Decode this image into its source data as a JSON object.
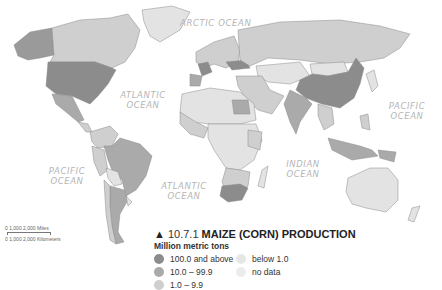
{
  "figure": {
    "number": "10.7.1",
    "title": "MAIZE (CORN) PRODUCTION",
    "marker": "▲"
  },
  "legend": {
    "unit": "Million metric tons",
    "items": [
      {
        "label": "100.0 and above",
        "color": "#8c8c8c"
      },
      {
        "label": "below 1.0",
        "color": "#e6e6e6"
      },
      {
        "label": "10.0 – 99.9",
        "color": "#aaaaaa"
      },
      {
        "label": "no data",
        "color": "#ececec"
      },
      {
        "label": "1.0 – 9.9",
        "color": "#cfcfcf"
      }
    ]
  },
  "oceans": {
    "arctic": "ARCTIC OCEAN",
    "atlantic_north": "ATLANTIC OCEAN",
    "atlantic_south": "ATLANTIC OCEAN",
    "pacific_east": "PACIFIC OCEAN",
    "pacific_west": "PACIFIC OCEAN",
    "indian": "INDIAN OCEAN"
  },
  "scale_bar": {
    "miles": "0     1,000     2,000 Miles",
    "km": "0   1,000   2,000 Kilometers"
  },
  "colors": {
    "high": "#8c8c8c",
    "mid": "#aaaaaa",
    "low": "#cfcfcf",
    "below": "#e3e3e3",
    "border": "#777777"
  }
}
